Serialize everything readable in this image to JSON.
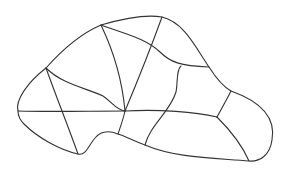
{
  "diagram": {
    "kind": "partitioned-region",
    "line_color": "#333333",
    "background_color": "#ffffff",
    "outline_count": 1,
    "internal_edge_count": 12,
    "region_count": 11
  }
}
